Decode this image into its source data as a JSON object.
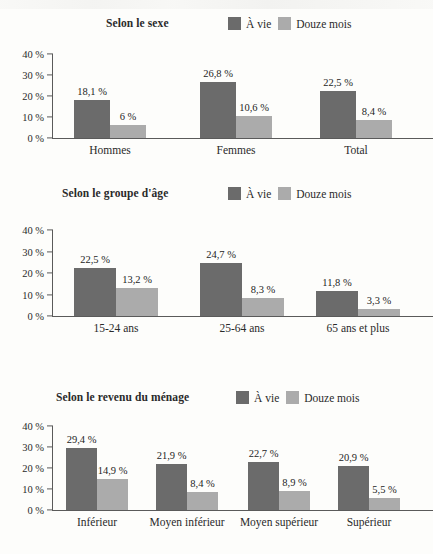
{
  "legend": {
    "series": [
      {
        "name": "a-vie",
        "label": "À vie",
        "color": "#6b6b6b"
      },
      {
        "name": "douze-mois",
        "label": "Douze mois",
        "color": "#ababab"
      }
    ]
  },
  "axis": {
    "yticks": [
      "0 %",
      "10 %",
      "20 %",
      "30 %",
      "40 %"
    ],
    "ymax": 40
  },
  "charts": [
    {
      "title": "Selon le sexe",
      "categories": [
        "Hommes",
        "Femmes",
        "Total"
      ],
      "series": [
        {
          "label": "À vie",
          "values": [
            18.1,
            26.8,
            22.5
          ],
          "labels": [
            "18,1 %",
            "26,8 %",
            "22,5 %"
          ]
        },
        {
          "label": "Douze mois",
          "values": [
            6.0,
            10.6,
            8.4
          ],
          "labels": [
            "6 %",
            "10,6 %",
            "8,4 %"
          ]
        }
      ]
    },
    {
      "title": "Selon le groupe d'âge",
      "categories": [
        "15-24 ans",
        "25-64 ans",
        "65 ans et plus"
      ],
      "series": [
        {
          "label": "À vie",
          "values": [
            22.5,
            24.7,
            11.8
          ],
          "labels": [
            "22,5 %",
            "24,7 %",
            "11,8 %"
          ]
        },
        {
          "label": "Douze mois",
          "values": [
            13.2,
            8.3,
            3.3
          ],
          "labels": [
            "13,2 %",
            "8,3 %",
            "3,3 %"
          ]
        }
      ]
    },
    {
      "title": "Selon le revenu du ménage",
      "categories": [
        "Inférieur",
        "Moyen inférieur",
        "Moyen supérieur",
        "Supérieur"
      ],
      "series": [
        {
          "label": "À vie",
          "values": [
            29.4,
            21.9,
            22.7,
            20.9
          ],
          "labels": [
            "29,4 %",
            "21,9 %",
            "22,7 %",
            "20,9 %"
          ]
        },
        {
          "label": "Douze mois",
          "values": [
            14.9,
            8.4,
            8.9,
            5.5
          ],
          "labels": [
            "14,9 %",
            "8,4 %",
            "8,9 %",
            "5,5 %"
          ]
        }
      ]
    }
  ],
  "chart_data": [
    {
      "type": "bar",
      "title": "Selon le sexe",
      "categories": [
        "Hommes",
        "Femmes",
        "Total"
      ],
      "series": [
        {
          "name": "À vie",
          "values": [
            18.1,
            26.8,
            22.5
          ]
        },
        {
          "name": "Douze mois",
          "values": [
            6.0,
            10.6,
            8.4
          ]
        }
      ],
      "xlabel": "",
      "ylabel": "",
      "ylim": [
        0,
        40
      ],
      "yticks": [
        0,
        10,
        20,
        30,
        40
      ],
      "ytick_labels": [
        "0 %",
        "10 %",
        "20 %",
        "30 %",
        "40 %"
      ],
      "grid": false,
      "legend_position": "top-right",
      "data_labels": [
        "18,1 %",
        "6 %",
        "26,8 %",
        "10,6 %",
        "22,5 %",
        "8,4 %"
      ]
    },
    {
      "type": "bar",
      "title": "Selon le groupe d'âge",
      "categories": [
        "15-24 ans",
        "25-64 ans",
        "65 ans et plus"
      ],
      "series": [
        {
          "name": "À vie",
          "values": [
            22.5,
            24.7,
            11.8
          ]
        },
        {
          "name": "Douze mois",
          "values": [
            13.2,
            8.3,
            3.3
          ]
        }
      ],
      "xlabel": "",
      "ylabel": "",
      "ylim": [
        0,
        40
      ],
      "yticks": [
        0,
        10,
        20,
        30,
        40
      ],
      "ytick_labels": [
        "0 %",
        "10 %",
        "20 %",
        "30 %",
        "40 %"
      ],
      "grid": false,
      "legend_position": "top-right",
      "data_labels": [
        "22,5 %",
        "13,2 %",
        "24,7 %",
        "8,3 %",
        "11,8 %",
        "3,3 %"
      ]
    },
    {
      "type": "bar",
      "title": "Selon le revenu du ménage",
      "categories": [
        "Inférieur",
        "Moyen inférieur",
        "Moyen supérieur",
        "Supérieur"
      ],
      "series": [
        {
          "name": "À vie",
          "values": [
            29.4,
            21.9,
            22.7,
            20.9
          ]
        },
        {
          "name": "Douze mois",
          "values": [
            14.9,
            8.4,
            8.9,
            5.5
          ]
        }
      ],
      "xlabel": "",
      "ylabel": "",
      "ylim": [
        0,
        40
      ],
      "yticks": [
        0,
        10,
        20,
        30,
        40
      ],
      "ytick_labels": [
        "0 %",
        "10 %",
        "20 %",
        "30 %",
        "40 %"
      ],
      "grid": false,
      "legend_position": "top-right",
      "data_labels": [
        "29,4 %",
        "14,9 %",
        "21,9 %",
        "8,4 %",
        "22,7 %",
        "8,9 %",
        "20,9 %",
        "5,5 %"
      ]
    }
  ]
}
